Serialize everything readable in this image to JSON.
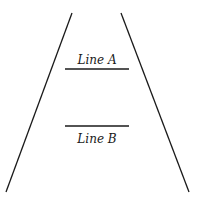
{
  "diagram": {
    "line_a": {
      "label": "Line A",
      "x1": 65,
      "x2": 129,
      "y": 69,
      "label_y": 64
    },
    "line_b": {
      "label": "Line B",
      "x1": 65,
      "x2": 129,
      "y": 126,
      "label_y": 143
    },
    "left_rail": {
      "x1": 72,
      "y1": 13,
      "x2": 6,
      "y2": 192
    },
    "right_rail": {
      "x1": 121,
      "y1": 13,
      "x2": 189,
      "y2": 192
    },
    "stroke_color": "#1a1a1a"
  }
}
